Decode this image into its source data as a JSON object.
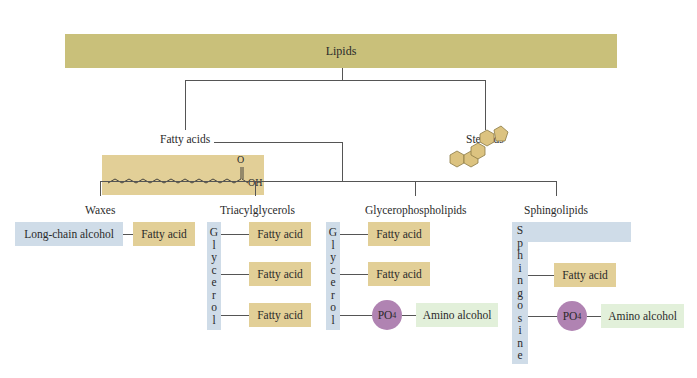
{
  "title": "Lipids",
  "level1": {
    "fatty_acids": {
      "label": "Fatty acids",
      "structure_text_O": "O",
      "structure_text_OH": "OH"
    },
    "steroids": {
      "label": "Steroids"
    }
  },
  "classes": {
    "waxes": {
      "label": "Waxes",
      "alcohol": "Long-chain alcohol",
      "fatty_acid": "Fatty acid"
    },
    "triacylglycerols": {
      "label": "Triacylglycerols",
      "backbone": [
        "G",
        "l",
        "y",
        "c",
        "e",
        "r",
        "o",
        "l"
      ],
      "fatty_acids": [
        "Fatty acid",
        "Fatty acid",
        "Fatty acid"
      ]
    },
    "glycerophospholipids": {
      "label": "Glycerophospholipids",
      "backbone": [
        "G",
        "l",
        "y",
        "c",
        "e",
        "r",
        "o",
        "l"
      ],
      "fatty_acids": [
        "Fatty acid",
        "Fatty acid"
      ],
      "phosphate": "PO",
      "phosphate_sub": "4",
      "amino_alcohol": "Amino alcohol"
    },
    "sphingolipids": {
      "label": "Sphingolipids",
      "backbone": [
        "S",
        "p",
        "h",
        "i",
        "n",
        "g",
        "o",
        "s",
        "i",
        "n",
        "e"
      ],
      "fatty_acid": "Fatty acid",
      "phosphate": "PO",
      "phosphate_sub": "4",
      "amino_alcohol": "Amino alcohol"
    }
  },
  "colors": {
    "title_bar": "#c9c07a",
    "tan": "#e2cf97",
    "blue": "#cfdce8",
    "green": "#e2f0da",
    "phosphate": "#b083b2"
  }
}
